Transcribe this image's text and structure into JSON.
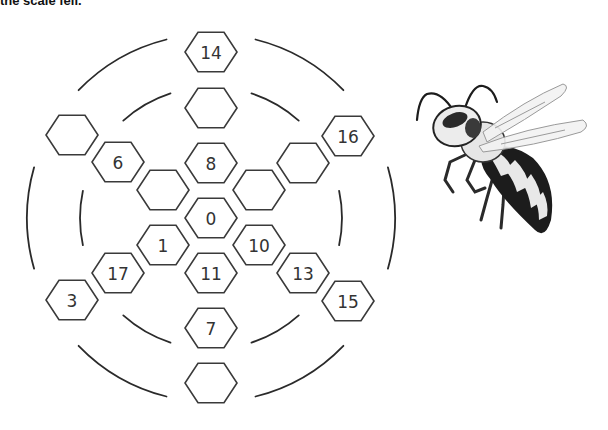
{
  "caption": "the scale fell.",
  "board": {
    "center": [
      211,
      218
    ],
    "hex_size": 26,
    "stroke_color": "#3a3a3a",
    "hexes": [
      {
        "id": "h-top-outer",
        "x": 211,
        "y": 52,
        "label": "14"
      },
      {
        "id": "h-top-mid",
        "x": 211,
        "y": 108,
        "label": ""
      },
      {
        "id": "h-top-inner",
        "x": 211,
        "y": 163,
        "label": "8"
      },
      {
        "id": "h-center",
        "x": 211,
        "y": 218,
        "label": "0"
      },
      {
        "id": "h-bottom-inner",
        "x": 211,
        "y": 273,
        "label": "11"
      },
      {
        "id": "h-bottom-mid",
        "x": 211,
        "y": 328,
        "label": "7"
      },
      {
        "id": "h-bottom-outer",
        "x": 211,
        "y": 383,
        "label": ""
      },
      {
        "id": "h-ul-inner",
        "x": 163,
        "y": 190,
        "label": ""
      },
      {
        "id": "h-ul-mid",
        "x": 118,
        "y": 162,
        "label": "6"
      },
      {
        "id": "h-ul-outer",
        "x": 72,
        "y": 135,
        "label": ""
      },
      {
        "id": "h-ur-inner",
        "x": 259,
        "y": 190,
        "label": ""
      },
      {
        "id": "h-ur-mid",
        "x": 303,
        "y": 163,
        "label": ""
      },
      {
        "id": "h-ur-outer",
        "x": 348,
        "y": 136,
        "label": "16"
      },
      {
        "id": "h-ll-inner",
        "x": 163,
        "y": 245,
        "label": "1"
      },
      {
        "id": "h-ll-mid",
        "x": 118,
        "y": 273,
        "label": "17"
      },
      {
        "id": "h-ll-outer",
        "x": 72,
        "y": 300,
        "label": "3"
      },
      {
        "id": "h-lr-inner",
        "x": 259,
        "y": 245,
        "label": "10"
      },
      {
        "id": "h-lr-mid",
        "x": 303,
        "y": 273,
        "label": "13"
      },
      {
        "id": "h-lr-outer",
        "x": 348,
        "y": 301,
        "label": "15"
      }
    ],
    "rings": [
      {
        "name": "inner-ring",
        "radius": 131
      },
      {
        "name": "outer-ring",
        "radius": 184
      }
    ]
  },
  "illustration": {
    "subject": "wasp",
    "colors": {
      "body_dark": "#1c1c1c",
      "body_light": "#e8e8e8",
      "wing": "#f2f2f2",
      "wing_edge": "#9a9a9a"
    }
  }
}
